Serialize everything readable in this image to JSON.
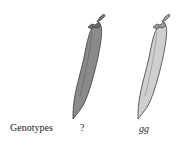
{
  "figure": {
    "row_label": "Genotypes",
    "pods": [
      {
        "genotype": "?",
        "color": "#8a8a8a",
        "description": "dark (green) pod"
      },
      {
        "genotype": "gg",
        "color": "#cfcfcf",
        "description": "light (yellow) pod"
      }
    ],
    "outline_color": "#3a3a3a"
  }
}
